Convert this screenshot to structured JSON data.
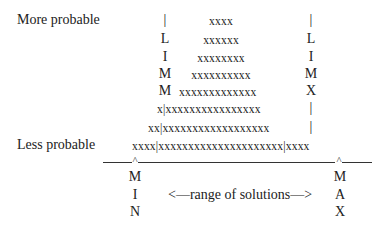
{
  "labels": {
    "more_probable": "More probable",
    "less_probable": "Less probable"
  },
  "left_limit": {
    "letters": [
      "|",
      "L",
      "I",
      "M",
      "M"
    ],
    "full": "|LIMM"
  },
  "right_limit": {
    "letters": [
      "|",
      "L",
      "I",
      "M",
      "X",
      "|",
      "|"
    ],
    "full": "|LIMX||"
  },
  "distribution_rows": [
    {
      "left": "",
      "center": "xxxx",
      "right": ""
    },
    {
      "left": "",
      "center": "xxxxxx",
      "right": ""
    },
    {
      "left": "",
      "center": "xxxxxxxx",
      "right": ""
    },
    {
      "left": "",
      "center": "xxxxxxxxxx",
      "right": ""
    },
    {
      "left": "",
      "center": "xxxxxxxxxxxxx",
      "right": ""
    },
    {
      "left": "x",
      "center": "xxxxxxxxxxxxxxxx",
      "right": ""
    },
    {
      "left": "xx",
      "center": "xxxxxxxxxxxxxxxxxx",
      "right": ""
    },
    {
      "left": "xxxx",
      "center": "xxxxxxxxxxxxxxxxxxxxx",
      "right": "xxxx"
    }
  ],
  "rows_text": {
    "r1": "xxxx",
    "r2": "xxxxxx",
    "r3": "xxxxxxxx",
    "r4": "xxxxxxxxxx",
    "r5": "xxxxxxxxxxxxx",
    "r6": "x|xxxxxxxxxxxxxxxx",
    "r7": "xx|xxxxxxxxxxxxxxxxxx",
    "r8": "xxxx|xxxxxxxxxxxxxxxxxxxxx|xxxx"
  },
  "axis": {
    "min_marker": "^",
    "max_marker": "^",
    "min_label": [
      "M",
      "I",
      "N"
    ],
    "max_label": [
      "M",
      "A",
      "X"
    ],
    "range_label": "<—range of solutions—>"
  }
}
